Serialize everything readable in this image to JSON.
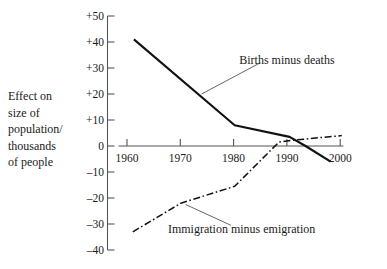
{
  "chart_data": {
    "type": "line",
    "title": "",
    "xlabel": "",
    "ylabel": "Effect on size of population/ thousands of people",
    "ylabel_lines": [
      "Effect on",
      "size of",
      "population/",
      "thousands",
      "of people"
    ],
    "xlim": [
      1958,
      2001
    ],
    "ylim": [
      -40,
      50
    ],
    "xticks": [
      1960,
      1970,
      1980,
      1990,
      2000
    ],
    "xtick_labels": [
      "1960",
      "1970",
      "1980",
      "1990",
      "2000"
    ],
    "yticks": [
      50,
      40,
      30,
      20,
      10,
      0,
      -10,
      -20,
      -30,
      -40
    ],
    "ytick_labels": [
      "+50",
      "+40",
      "+30",
      "+20",
      "+10",
      "0",
      "–10",
      "–20",
      "–30",
      "–40"
    ],
    "grid": false,
    "legend_position": "inline-annotations",
    "series": [
      {
        "name": "Births minus deaths",
        "style": "solid",
        "x": [
          1961.3,
          1980.2,
          1990.5,
          1993.5,
          1998.2
        ],
        "values": [
          41,
          8,
          3.5,
          0,
          -6
        ]
      },
      {
        "name": "Immigration minus emigration",
        "style": "dash-dot",
        "x": [
          1961.1,
          1970.1,
          1980.2,
          1988.5,
          1991.0,
          2000.3
        ],
        "values": [
          -33,
          -22,
          -15.5,
          1.5,
          2.2,
          4
        ]
      }
    ],
    "annotations": [
      {
        "text": "Births minus deaths",
        "label_x": 1990.0,
        "label_y": 33.0,
        "leader_from_x": 1985.0,
        "leader_from_y": 32.0,
        "leader_to_x": 1974.0,
        "leader_to_y": 20.0
      },
      {
        "text": "Immigration minus emigration",
        "label_x": 1981.5,
        "label_y": -32.0,
        "leader_from_x": 1979.5,
        "leader_from_y": -30.5,
        "leader_to_x": 1971.0,
        "leader_to_y": -22.5
      }
    ],
    "colors": {
      "line": "#111111",
      "axis": "#555555",
      "text": "#1a1a1a",
      "background": "#ffffff"
    }
  }
}
